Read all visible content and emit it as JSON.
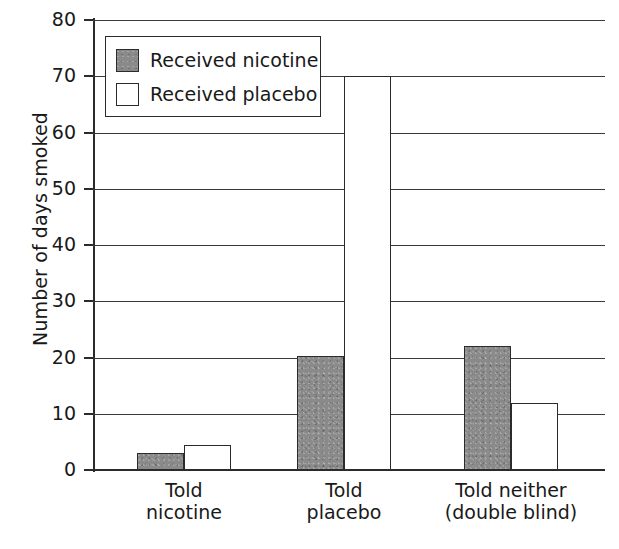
{
  "chart_data": {
    "type": "bar",
    "title": "",
    "xlabel": "",
    "ylabel": "Number of days smoked",
    "ylim": [
      0,
      80
    ],
    "ytick_labels": [
      "0",
      "10",
      "20",
      "30",
      "40",
      "50",
      "60",
      "70",
      "80"
    ],
    "ytick_values": [
      0,
      10,
      20,
      30,
      40,
      50,
      60,
      70,
      80
    ],
    "grid": true,
    "legend_position": "top-left-inside",
    "categories": [
      "Told nicotine",
      "Told placebo",
      "Told neither (double blind)"
    ],
    "category_lines": [
      [
        "Told",
        "nicotine"
      ],
      [
        "Told",
        "placebo"
      ],
      [
        "Told neither",
        "(double blind)"
      ]
    ],
    "series": [
      {
        "name": "Received nicotine",
        "color": "#8a8a8a",
        "values": [
          3,
          20.3,
          22
        ]
      },
      {
        "name": "Received placebo",
        "color": "#ffffff",
        "values": [
          4.5,
          70,
          12
        ]
      }
    ]
  },
  "legend": {
    "items": [
      {
        "label": "Received nicotine",
        "swatch": "filled-gray-swatch"
      },
      {
        "label": "Received placebo",
        "swatch": "empty-white-swatch"
      }
    ]
  }
}
